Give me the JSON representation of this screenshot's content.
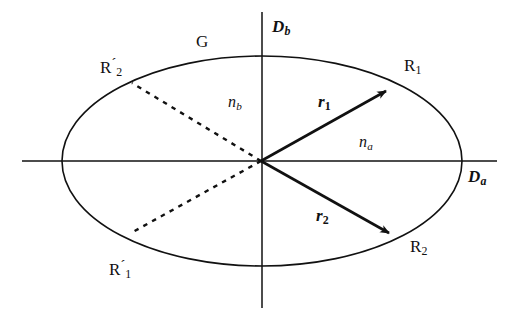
{
  "figure": {
    "kind": "optical-index-ellipse-diagram",
    "background_color": "#ffffff",
    "stroke_color": "#111111",
    "width": 517,
    "height": 319
  },
  "axes": {
    "horizontal": {
      "name": "horizontal-axis",
      "label": "D",
      "subscript": "a",
      "x1": 22,
      "y1": 161,
      "x2": 497,
      "y2": 161
    },
    "vertical": {
      "name": "vertical-axis",
      "label": "D",
      "subscript": "b",
      "x1": 262,
      "y1": 12,
      "x2": 262,
      "y2": 308
    }
  },
  "ellipse": {
    "label": "G",
    "cx": 262,
    "cy": 161,
    "rx": 200,
    "ry": 105
  },
  "media": {
    "inner_label": "n",
    "inner_subscript": "b",
    "outer_label": "n",
    "outer_subscript": "a"
  },
  "vectors": [
    {
      "name": "ray-vector-r1",
      "label": "r",
      "subscript": "1",
      "endpoint_label": "R",
      "endpoint_subscript": "1",
      "x1": 261,
      "y1": 161,
      "x2": 391,
      "y2": 88,
      "style": "solid-arrow"
    },
    {
      "name": "ray-vector-r2",
      "label": "r",
      "subscript": "2",
      "endpoint_label": "R",
      "endpoint_subscript": "2",
      "x1": 261,
      "y1": 161,
      "x2": 394,
      "y2": 236,
      "style": "solid-arrow"
    }
  ],
  "dashed_rays": [
    {
      "name": "dashed-ray-to-R2-prime",
      "endpoint_label": "R",
      "endpoint_prime": "´",
      "endpoint_subscript": "2",
      "x1": 261,
      "y1": 161,
      "x2": 132,
      "y2": 83
    },
    {
      "name": "dashed-ray-to-R1-prime",
      "endpoint_label": "R",
      "endpoint_prime": "´",
      "endpoint_subscript": "1",
      "x1": 261,
      "y1": 161,
      "x2": 131,
      "y2": 233
    }
  ],
  "labels": {
    "Db": {
      "text": "D",
      "sub": "b"
    },
    "Da": {
      "text": "D",
      "sub": "a"
    },
    "G": {
      "text": "G"
    },
    "nb": {
      "text": "n",
      "sub": "b"
    },
    "na": {
      "text": "n",
      "sub": "a"
    },
    "r1": {
      "text": "r",
      "sub": "1"
    },
    "r2": {
      "text": "r",
      "sub": "2"
    },
    "R1": {
      "text": "R",
      "sub": "1"
    },
    "R2": {
      "text": "R",
      "sub": "2"
    },
    "R1p": {
      "text": "R",
      "prime": "´",
      "sub": "1"
    },
    "R2p": {
      "text": "R",
      "prime": "´",
      "sub": "2"
    }
  }
}
